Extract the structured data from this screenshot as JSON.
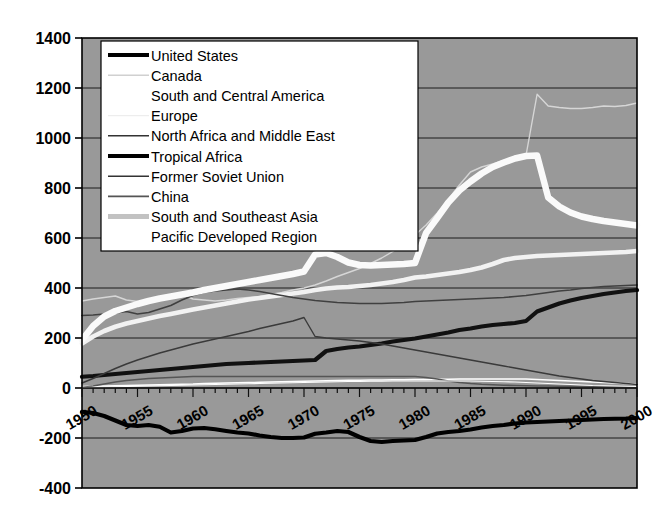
{
  "chart_data": {
    "type": "line",
    "title": "",
    "xlabel": "",
    "ylabel": "",
    "xlim": [
      1950,
      2000
    ],
    "ylim": [
      -400,
      1400
    ],
    "ytick_step": 200,
    "yticks": [
      -400,
      -200,
      0,
      200,
      400,
      600,
      800,
      1000,
      1200,
      1400
    ],
    "xticks": [
      1950,
      1955,
      1960,
      1965,
      1970,
      1975,
      1980,
      1985,
      1990,
      1995,
      2000
    ],
    "xtick_minor_step": 1,
    "xtick_label_rotation_deg": -30,
    "grid": "horizontal",
    "plot_bg": "#999999",
    "figure_bg": "#ffffff",
    "axis_color": "#000000",
    "legend_position": "top-left-inside",
    "legend_bg": "#ffffff",
    "x": [
      1950,
      1951,
      1952,
      1953,
      1954,
      1955,
      1956,
      1957,
      1958,
      1959,
      1960,
      1961,
      1962,
      1963,
      1964,
      1965,
      1966,
      1967,
      1968,
      1969,
      1970,
      1971,
      1972,
      1973,
      1974,
      1975,
      1976,
      1977,
      1978,
      1979,
      1980,
      1981,
      1982,
      1983,
      1984,
      1985,
      1986,
      1987,
      1988,
      1989,
      1990,
      1991,
      1992,
      1993,
      1994,
      1995,
      1996,
      1997,
      1998,
      1999,
      2000
    ],
    "series": [
      {
        "name": "United States",
        "color": "#000000",
        "width": 4.2,
        "values": [
          -95,
          -100,
          -112,
          -130,
          -148,
          -152,
          -148,
          -155,
          -178,
          -172,
          -162,
          -160,
          -165,
          -172,
          -178,
          -182,
          -190,
          -196,
          -200,
          -200,
          -198,
          -183,
          -178,
          -172,
          -176,
          -196,
          -212,
          -216,
          -212,
          -210,
          -208,
          -196,
          -182,
          -176,
          -172,
          -166,
          -158,
          -152,
          -148,
          -142,
          -138,
          -136,
          -134,
          -132,
          -130,
          -128,
          -126,
          -124,
          -123,
          -122,
          -120
        ]
      },
      {
        "name": "Canada",
        "color": "#d6d6d6",
        "width": 1.4,
        "values": [
          348,
          356,
          362,
          368,
          352,
          346,
          342,
          352,
          368,
          374,
          356,
          352,
          348,
          352,
          358,
          362,
          366,
          374,
          382,
          392,
          400,
          412,
          428,
          446,
          462,
          478,
          498,
          520,
          546,
          578,
          612,
          652,
          700,
          754,
          812,
          864,
          884,
          896,
          910,
          922,
          930,
          1175,
          1128,
          1122,
          1118,
          1118,
          1122,
          1128,
          1126,
          1130,
          1140
        ]
      },
      {
        "name": "South and Central America",
        "color": "#ffffff",
        "width": 1.4,
        "values": [
          6,
          7,
          8,
          9,
          10,
          11,
          12,
          13,
          14,
          15,
          16,
          18,
          19,
          20,
          21,
          22,
          23,
          24,
          25,
          26,
          27,
          28,
          29,
          30,
          31,
          31,
          32,
          32,
          33,
          33,
          34,
          34,
          35,
          35,
          36,
          36,
          36,
          36,
          36,
          36,
          36,
          34,
          32,
          30,
          28,
          26,
          24,
          22,
          20,
          18,
          16
        ]
      },
      {
        "name": "Europe",
        "color": "#f2f2f2",
        "width": 4.6,
        "values": [
          178,
          206,
          228,
          245,
          258,
          268,
          278,
          288,
          296,
          305,
          314,
          322,
          330,
          338,
          346,
          354,
          360,
          366,
          372,
          378,
          384,
          392,
          398,
          402,
          404,
          408,
          412,
          418,
          424,
          432,
          442,
          446,
          452,
          458,
          464,
          472,
          482,
          496,
          512,
          520,
          524,
          528,
          530,
          532,
          534,
          536,
          538,
          540,
          542,
          544,
          548
        ]
      },
      {
        "name": "North Africa and Middle East",
        "color": "#404040",
        "width": 1.6,
        "values": [
          290,
          292,
          296,
          300,
          306,
          296,
          302,
          316,
          330,
          352,
          370,
          382,
          388,
          392,
          396,
          392,
          386,
          378,
          370,
          362,
          356,
          350,
          346,
          342,
          340,
          338,
          338,
          338,
          340,
          342,
          346,
          348,
          350,
          352,
          354,
          356,
          358,
          360,
          362,
          366,
          370,
          376,
          382,
          388,
          392,
          398,
          402,
          406,
          408,
          410,
          412
        ]
      },
      {
        "name": "Tropical Africa",
        "color": "#111111",
        "width": 4.2,
        "values": [
          45,
          48,
          52,
          56,
          60,
          64,
          68,
          72,
          76,
          80,
          84,
          88,
          92,
          96,
          98,
          100,
          102,
          104,
          106,
          108,
          110,
          112,
          148,
          156,
          162,
          166,
          172,
          178,
          186,
          192,
          198,
          206,
          214,
          222,
          232,
          238,
          246,
          252,
          256,
          260,
          268,
          306,
          322,
          338,
          350,
          360,
          368,
          376,
          382,
          388,
          392
        ]
      },
      {
        "name": "Former Soviet Union",
        "color": "#3a3a3a",
        "width": 1.4,
        "values": [
          20,
          38,
          58,
          78,
          96,
          112,
          126,
          140,
          152,
          164,
          176,
          186,
          196,
          206,
          216,
          226,
          238,
          248,
          258,
          268,
          282,
          206,
          200,
          196,
          192,
          188,
          182,
          176,
          168,
          160,
          152,
          144,
          136,
          128,
          120,
          112,
          104,
          96,
          88,
          80,
          72,
          64,
          56,
          48,
          42,
          36,
          30,
          26,
          22,
          18,
          14
        ]
      },
      {
        "name": "China",
        "color": "#555555",
        "width": 1.6,
        "values": [
          2,
          8,
          16,
          24,
          30,
          34,
          38,
          40,
          42,
          44,
          46,
          46,
          46,
          46,
          46,
          46,
          46,
          46,
          46,
          46,
          46,
          46,
          46,
          46,
          46,
          46,
          46,
          46,
          46,
          46,
          46,
          42,
          36,
          28,
          22,
          18,
          15,
          13,
          11,
          10,
          9,
          8,
          8,
          7,
          7,
          6,
          6,
          5,
          5,
          5,
          4
        ]
      },
      {
        "name": "South and Southeast Asia",
        "color": "#fafafa",
        "width": 6.5,
        "values": [
          192,
          248,
          286,
          308,
          322,
          336,
          348,
          358,
          366,
          374,
          382,
          392,
          400,
          408,
          416,
          424,
          432,
          440,
          448,
          456,
          466,
          534,
          540,
          524,
          502,
          492,
          490,
          492,
          494,
          496,
          500,
          620,
          680,
          742,
          790,
          826,
          858,
          884,
          902,
          918,
          928,
          930,
          762,
          726,
          702,
          686,
          676,
          668,
          662,
          656,
          650
        ]
      },
      {
        "name": "Pacific Developed Region",
        "color": "#ffffff",
        "width": 1.2,
        "values": [
          2,
          3,
          4,
          5,
          6,
          7,
          8,
          9,
          10,
          11,
          12,
          13,
          14,
          15,
          16,
          17,
          18,
          19,
          20,
          21,
          22,
          23,
          24,
          25,
          26,
          26,
          27,
          27,
          28,
          28,
          28,
          28,
          28,
          28,
          28,
          28,
          27,
          26,
          25,
          24,
          22,
          20,
          18,
          16,
          14,
          12,
          10,
          9,
          8,
          7,
          6
        ]
      }
    ]
  },
  "legend": {
    "entries": [
      {
        "label": "United  States",
        "swatch": "thick-black"
      },
      {
        "label": "Canada",
        "swatch": "thin-lightgray"
      },
      {
        "label": "South and Central America",
        "swatch": "thin-white"
      },
      {
        "label": "Europe",
        "swatch": "thin-paleygray"
      },
      {
        "label": "North Africa and Middle East",
        "swatch": "thin-darkgray"
      },
      {
        "label": "Tropical Africa",
        "swatch": "thick-black"
      },
      {
        "label": "Former Soviet Union",
        "swatch": "thin-darkgray"
      },
      {
        "label": "China",
        "swatch": "thin-gray"
      },
      {
        "label": "South and Southeast Asia",
        "swatch": "thick-lightgray"
      },
      {
        "label": "Pacific Developed Region",
        "swatch": "thin-white"
      }
    ]
  }
}
